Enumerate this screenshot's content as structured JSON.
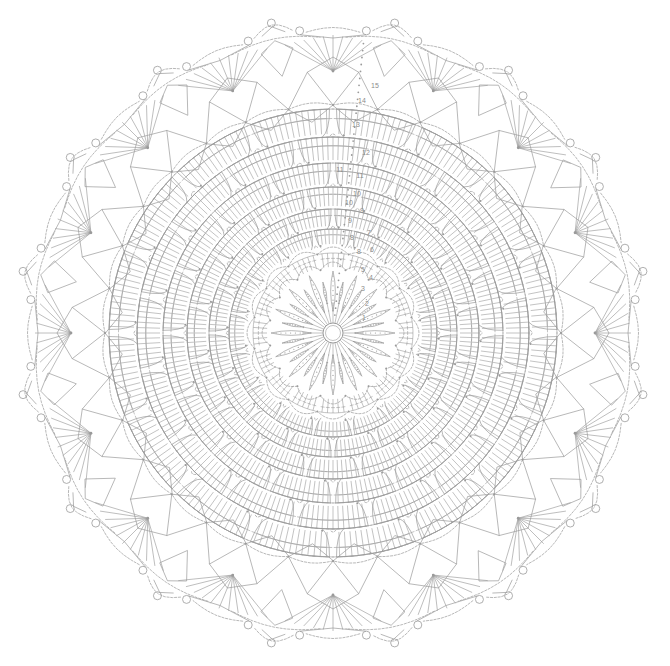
{
  "document": {
    "kind": "crochet-pattern-chart",
    "title": "Round Doily Crochet Chart",
    "background_color": "#ffffff",
    "line_color": "#9a9a9a",
    "label_color": "#8c8c8c",
    "canvas": {
      "width": 670,
      "height": 666
    }
  },
  "chart_data": {
    "type": "diagram",
    "symmetry": {
      "type": "radial",
      "center_x": 333,
      "center_y": 333,
      "sectors": 16
    },
    "round_labels": [
      "1",
      "2",
      "3",
      "4",
      "5",
      "6",
      "7",
      "8",
      "9",
      "10",
      "11",
      "12",
      "13",
      "14",
      "15"
    ],
    "rounds": [
      {
        "number": "1",
        "radius": 16,
        "label_x": 364,
        "label_y": 320,
        "motif": "center-ring",
        "stitch": "chain-ring"
      },
      {
        "number": "2",
        "radius": 30,
        "label_x": 367,
        "label_y": 306,
        "motif": "radiating-spokes",
        "stitch": "double-crochet"
      },
      {
        "number": "3",
        "radius": 46,
        "label_x": 363,
        "label_y": 291,
        "motif": "petal-ring",
        "stitch": "puff-petal"
      },
      {
        "number": "4",
        "radius": 62,
        "label_x": 371,
        "label_y": 280,
        "motif": "chain-arch",
        "stitch": "chain-arch"
      },
      {
        "number": "5",
        "radius": 78,
        "label_x": 363,
        "label_y": 272,
        "motif": "shell-fan",
        "stitch": "double-crochet"
      },
      {
        "number": "6",
        "radius": 94,
        "label_x": 372,
        "label_y": 252,
        "motif": "shell-fan",
        "stitch": "double-crochet"
      },
      {
        "number": "7",
        "radius": 110,
        "label_x": 369,
        "label_y": 235,
        "motif": "arc-band",
        "stitch": "double-crochet"
      },
      {
        "number": "8",
        "radius": 128,
        "label_x": 359,
        "label_y": 254,
        "motif": "arc-band",
        "stitch": "double-crochet"
      },
      {
        "number": "9",
        "radius": 146,
        "label_x": 362,
        "label_y": 213,
        "motif": "arc-band",
        "stitch": "double-crochet"
      },
      {
        "number": "10",
        "radius": 166,
        "label_x": 357,
        "label_y": 196,
        "motif": "arc-band",
        "stitch": "double-crochet"
      },
      {
        "number": "11",
        "radius": 186,
        "label_x": 360,
        "label_y": 178,
        "motif": "arc-band",
        "stitch": "double-crochet"
      },
      {
        "number": "12",
        "radius": 206,
        "label_x": 366,
        "label_y": 155,
        "motif": "mesh-diamond",
        "stitch": "chain-mesh"
      },
      {
        "number": "13",
        "radius": 228,
        "label_x": 356,
        "label_y": 127,
        "motif": "mesh-diamond",
        "stitch": "chain-mesh"
      },
      {
        "number": "14",
        "radius": 250,
        "label_x": 362,
        "label_y": 103,
        "motif": "star-fan",
        "stitch": "treble-crochet"
      },
      {
        "number": "15",
        "radius": 276,
        "label_x": 375,
        "label_y": 88,
        "motif": "picot-scallop-edge",
        "stitch": "picot"
      }
    ],
    "extra_labels": [
      {
        "text": "11",
        "x": 340,
        "y": 172
      },
      {
        "text": "10",
        "x": 349,
        "y": 205
      },
      {
        "text": "9",
        "x": 350,
        "y": 223
      },
      {
        "text": "8",
        "x": 352,
        "y": 240
      }
    ],
    "edge": {
      "picot_rings": 32,
      "scallop_count": 16,
      "picot_radius": 4
    },
    "center": {
      "ring_radius": 10,
      "petal_count": 16
    }
  }
}
